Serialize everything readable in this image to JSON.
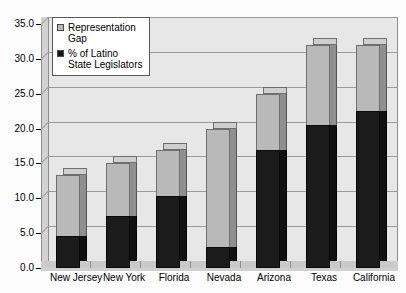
{
  "chart_data": {
    "type": "bar",
    "title": "",
    "subtitle": "",
    "xlabel": "",
    "ylabel": "",
    "ylim": [
      0,
      35
    ],
    "ytick_step": 5,
    "ytick_labels": [
      "0.0",
      "5.0",
      "10.0",
      "15.0",
      "20.0",
      "25.0",
      "30.0",
      "35.0"
    ],
    "ytick_values": [
      0,
      5,
      10,
      15,
      20,
      25,
      30,
      35
    ],
    "grid": true,
    "stacked": true,
    "three_d": true,
    "legend_position": "top-left",
    "categories": [
      "New Jersey",
      "New York",
      "Florida",
      "Nevada",
      "Arizona",
      "Texas",
      "California"
    ],
    "series": [
      {
        "name": "% of Latino State Legislators",
        "color": "#1b1b1b",
        "values": [
          4.6,
          7.5,
          10.3,
          3.0,
          17.0,
          20.5,
          22.5
        ]
      },
      {
        "name": "Representation Gap",
        "color": "#b9b9b9",
        "values": [
          8.7,
          7.5,
          6.7,
          17.0,
          8.0,
          11.5,
          9.5
        ]
      }
    ],
    "totals": [
      13.3,
      15.0,
      17.0,
      20.0,
      25.0,
      32.0,
      32.0
    ]
  },
  "legend": {
    "items": [
      {
        "label": "Representation\nGap",
        "swatch": "gray-swatch"
      },
      {
        "label": "% of Latino\nState Legislators",
        "swatch": "black-swatch"
      }
    ]
  },
  "colors": {
    "plot_background": "#e7e7e7",
    "gridline": "#9a9a9a",
    "gap_series": "#b9b9b9",
    "base_series": "#1b1b1b",
    "axis": "#000000",
    "page_background": "#ffffff"
  }
}
